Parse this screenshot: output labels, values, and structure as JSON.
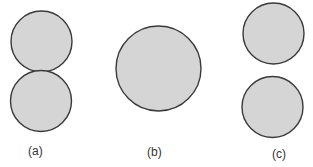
{
  "colors": {
    "circle_fill": "#d5d5d5",
    "circle_stroke": "#3a3a3a",
    "label_text": "#333333"
  },
  "panels": [
    {
      "id": "a",
      "label": "(a)",
      "description": "two touching circles stacked vertically",
      "circles": [
        {
          "cx": 41.5,
          "cy": 41.5,
          "r": 30.5
        },
        {
          "cx": 41,
          "cy": 101,
          "r": 30.5
        }
      ]
    },
    {
      "id": "b",
      "label": "(b)",
      "description": "single larger circle",
      "circles": [
        {
          "cx": 158.5,
          "cy": 68.5,
          "r": 42.5
        }
      ]
    },
    {
      "id": "c",
      "label": "(c)",
      "description": "two separated circles stacked vertically",
      "circles": [
        {
          "cx": 273.5,
          "cy": 33.5,
          "r": 30.5
        },
        {
          "cx": 272.5,
          "cy": 107,
          "r": 30.5
        }
      ]
    }
  ]
}
